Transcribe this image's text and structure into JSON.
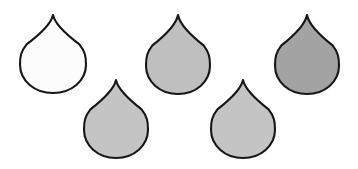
{
  "figure": {
    "background_color": "#ffffff",
    "width": 358,
    "height": 169,
    "outline_color": "#161616",
    "outline_width": 2.1,
    "shape_count": 5,
    "shape_kind": "teardrop"
  },
  "shapes": [
    {
      "id": "droplet-1",
      "label": "Droplet 1",
      "position": "top-left",
      "fill": "#fcfcfc",
      "tip_x": 53,
      "tip_y": 15,
      "center_x": 53,
      "center_y": 63,
      "radius_x": 33,
      "radius_y": 30,
      "bottom_y": 93
    },
    {
      "id": "droplet-2",
      "label": "Droplet 2",
      "position": "top-center",
      "fill": "#bfbfbf",
      "tip_x": 178,
      "tip_y": 15,
      "center_x": 178,
      "center_y": 64,
      "radius_x": 32,
      "radius_y": 30,
      "bottom_y": 94
    },
    {
      "id": "droplet-3",
      "label": "Droplet 3",
      "position": "top-right",
      "fill": "#a3a3a3",
      "tip_x": 307,
      "tip_y": 15,
      "center_x": 307,
      "center_y": 64,
      "radius_x": 32,
      "radius_y": 30,
      "bottom_y": 94
    },
    {
      "id": "droplet-4",
      "label": "Droplet 4",
      "position": "bottom-left",
      "fill": "#c4c4c4",
      "tip_x": 116,
      "tip_y": 80,
      "center_x": 116,
      "center_y": 128,
      "radius_x": 32,
      "radius_y": 30,
      "bottom_y": 158
    },
    {
      "id": "droplet-5",
      "label": "Droplet 5",
      "position": "bottom-center-right",
      "fill": "#c4c4c4",
      "tip_x": 243,
      "tip_y": 80,
      "center_x": 243,
      "center_y": 128,
      "radius_x": 32,
      "radius_y": 30,
      "bottom_y": 158
    }
  ]
}
